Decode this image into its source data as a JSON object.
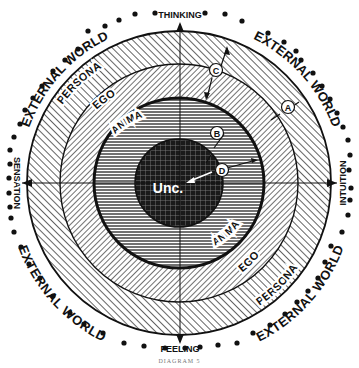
{
  "diagram": {
    "caption": "DIAGRAM 5",
    "outer_region": {
      "label": "EXTERNAL WORLD",
      "occurrences": 4
    },
    "functions": {
      "top": "THINKING",
      "bottom": "FEELING",
      "left": "SENSATION",
      "right": "INTUITION"
    },
    "rings": [
      {
        "label": "PERSONA",
        "order": 1
      },
      {
        "label": "EGO",
        "order": 2
      },
      {
        "label": "ANIMA",
        "order": 3
      },
      {
        "label": "Unc.",
        "order": 4
      }
    ],
    "markers": [
      "A",
      "B",
      "C",
      "D"
    ],
    "colors": {
      "ink": "#111111",
      "background": "#ffffff"
    }
  }
}
